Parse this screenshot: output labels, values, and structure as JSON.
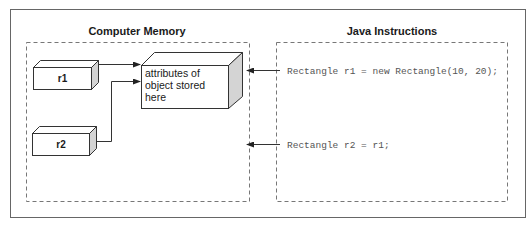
{
  "diagram": {
    "memory_panel": {
      "title": "Computer  Memory",
      "variables": [
        {
          "name": "r1"
        },
        {
          "name": "r2"
        }
      ],
      "object_box": {
        "lines": [
          "attributes of",
          "object stored",
          "here"
        ]
      }
    },
    "instructions_panel": {
      "title": "Java Instructions",
      "statements": [
        "Rectangle r1 = new Rectangle(10, 20);",
        "Rectangle r2 = r1;"
      ]
    },
    "colors": {
      "stroke": "#333333",
      "frame": "#555555",
      "dashed": "#666666",
      "side_fill": "#d4d4d4",
      "top_fill": "#ffffff",
      "code_text": "#555555"
    }
  }
}
